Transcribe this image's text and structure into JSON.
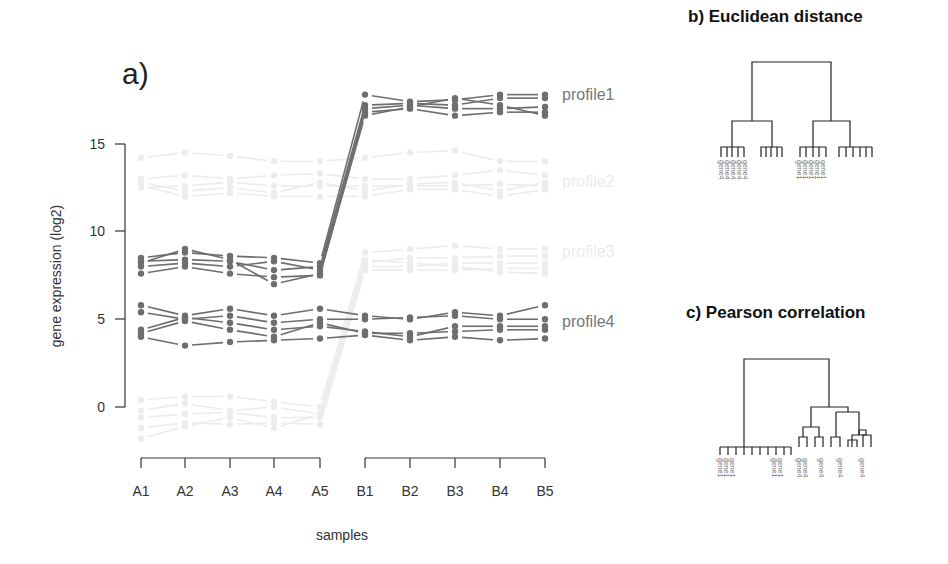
{
  "panel_a": {
    "label": "a)",
    "ylabel": "gene expression (log2)",
    "xlabel": "samples",
    "yticks": [
      "0",
      "5",
      "10",
      "15"
    ],
    "xticks": [
      "A1",
      "A2",
      "A3",
      "A4",
      "A5",
      "B1",
      "B2",
      "B3",
      "B4",
      "B5"
    ]
  },
  "panel_b": {
    "title": "b) Euclidean distance",
    "leaf_label_left": "gene4",
    "leaf_label_right": "gene1"
  },
  "panel_c": {
    "title": "c) Pearson correlation",
    "leaf_labels": [
      "gene1",
      "gene1",
      "gene1",
      "gene1",
      "gene1",
      "gene4",
      "gene4",
      "gene4",
      "gene4",
      "gene4"
    ]
  },
  "colors": {
    "profile_strong": "#6e6e6e",
    "profile_faint": "#ececec",
    "axis": "#333333",
    "dendrogram": "#222222"
  },
  "chart_data": [
    {
      "type": "line",
      "title": "a)",
      "xlabel": "samples",
      "ylabel": "gene expression (log2)",
      "ylim": [
        -2,
        18
      ],
      "yticks": [
        0,
        5,
        10,
        15
      ],
      "categories": [
        "A1",
        "A2",
        "A3",
        "A4",
        "A5",
        "B1",
        "B2",
        "B3",
        "B4",
        "B5"
      ],
      "grid": false,
      "series": [
        {
          "name": "profile1",
          "emphasis": "strong",
          "genes": [
            [
              8.5,
              8.8,
              8.6,
              8.5,
              8.2,
              17.8,
              17.4,
              17.5,
              17.8,
              17.8
            ],
            [
              8.3,
              8.4,
              8.3,
              7.8,
              8.0,
              17.2,
              17.3,
              17.2,
              17.6,
              17.6
            ],
            [
              8.0,
              8.2,
              8.0,
              8.3,
              7.8,
              17.0,
              17.2,
              17.0,
              17.0,
              17.1
            ],
            [
              7.6,
              8.0,
              7.6,
              7.4,
              7.5,
              16.8,
              17.0,
              16.6,
              16.8,
              16.8
            ],
            [
              8.2,
              9.0,
              8.4,
              7.0,
              7.6,
              16.6,
              17.1,
              17.6,
              17.2,
              16.6
            ]
          ]
        },
        {
          "name": "profile2",
          "emphasis": "faint",
          "genes": [
            [
              14.2,
              14.5,
              14.3,
              14.0,
              14.0,
              14.2,
              14.5,
              14.6,
              14.0,
              14.0
            ],
            [
              13.0,
              13.2,
              13.0,
              13.2,
              13.3,
              13.0,
              13.0,
              13.2,
              13.5,
              13.2
            ],
            [
              12.5,
              12.6,
              12.8,
              12.6,
              12.6,
              12.6,
              12.6,
              12.6,
              12.7,
              12.6
            ],
            [
              12.8,
              12.3,
              12.5,
              12.2,
              12.8,
              12.3,
              12.7,
              12.8,
              12.3,
              12.8
            ],
            [
              12.6,
              12.0,
              12.2,
              12.0,
              12.0,
              12.0,
              12.4,
              12.4,
              12.0,
              12.4
            ]
          ]
        },
        {
          "name": "profile3",
          "emphasis": "faint",
          "genes": [
            [
              0.4,
              0.6,
              0.6,
              0.3,
              0.0,
              8.8,
              9.0,
              9.2,
              9.0,
              9.0
            ],
            [
              -0.2,
              0.2,
              -0.2,
              0.0,
              -0.4,
              8.2,
              8.5,
              8.5,
              8.6,
              8.6
            ],
            [
              -0.6,
              -0.4,
              -0.3,
              -0.6,
              -0.6,
              8.0,
              8.0,
              8.2,
              8.2,
              8.2
            ],
            [
              -1.2,
              -0.9,
              -1.0,
              -0.9,
              -1.0,
              7.8,
              7.8,
              7.8,
              7.9,
              7.9
            ],
            [
              -1.8,
              -1.1,
              -0.6,
              -1.2,
              -0.4,
              8.4,
              8.2,
              8.0,
              7.7,
              7.6
            ]
          ]
        },
        {
          "name": "profile4",
          "emphasis": "strong",
          "genes": [
            [
              5.8,
              5.2,
              5.6,
              5.2,
              5.6,
              5.2,
              5.0,
              5.4,
              5.2,
              5.8
            ],
            [
              5.4,
              5.0,
              5.2,
              4.8,
              5.0,
              5.0,
              5.1,
              5.2,
              5.0,
              5.0
            ],
            [
              4.4,
              5.1,
              4.8,
              4.4,
              4.6,
              4.3,
              4.0,
              4.6,
              4.6,
              4.6
            ],
            [
              4.2,
              4.9,
              4.4,
              4.0,
              4.8,
              4.2,
              4.2,
              4.3,
              4.4,
              4.4
            ],
            [
              4.0,
              3.5,
              3.7,
              3.8,
              3.9,
              4.1,
              3.8,
              4.0,
              3.8,
              3.9
            ]
          ]
        }
      ],
      "annotations": [
        "profile1",
        "profile2",
        "profile3",
        "profile4"
      ]
    },
    {
      "type": "dendrogram",
      "title": "b) Euclidean distance",
      "structure": "two top clusters, each splitting into two groups of five leaves",
      "leaf_groups": [
        [
          "gene4",
          "gene4",
          "gene4",
          "gene4",
          "gene4"
        ],
        [
          "gene4",
          "gene4",
          "gene4",
          "gene4",
          "gene4"
        ],
        [
          "gene1",
          "gene1",
          "gene1",
          "gene1",
          "gene1"
        ],
        [
          "gene1",
          "gene1",
          "gene1",
          "gene1",
          "gene1"
        ]
      ]
    },
    {
      "type": "dendrogram",
      "title": "c) Pearson correlation",
      "structure": "left: flat cluster of ten genes; right: nested subclusters of ten genes",
      "leaf_labels_visible": [
        "gene1",
        "gene1",
        "gene1",
        "gene1",
        "gene1",
        "gene4",
        "gene4",
        "gene4",
        "gene4",
        "gene4"
      ]
    }
  ]
}
